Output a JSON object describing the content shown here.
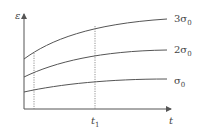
{
  "diagram": {
    "type": "creep-strain-curves",
    "axes": {
      "y_label": "ε",
      "x_label": "t",
      "x_marker_label": "t",
      "x_marker_sub": "1"
    },
    "curves": [
      {
        "label_prefix": "3σ",
        "label_sub": "0"
      },
      {
        "label_prefix": "2σ",
        "label_sub": "0"
      },
      {
        "label_prefix": "σ",
        "label_sub": "0"
      }
    ],
    "colors": {
      "line": "#555555",
      "dotted": "#777777",
      "text": "#444444"
    }
  }
}
